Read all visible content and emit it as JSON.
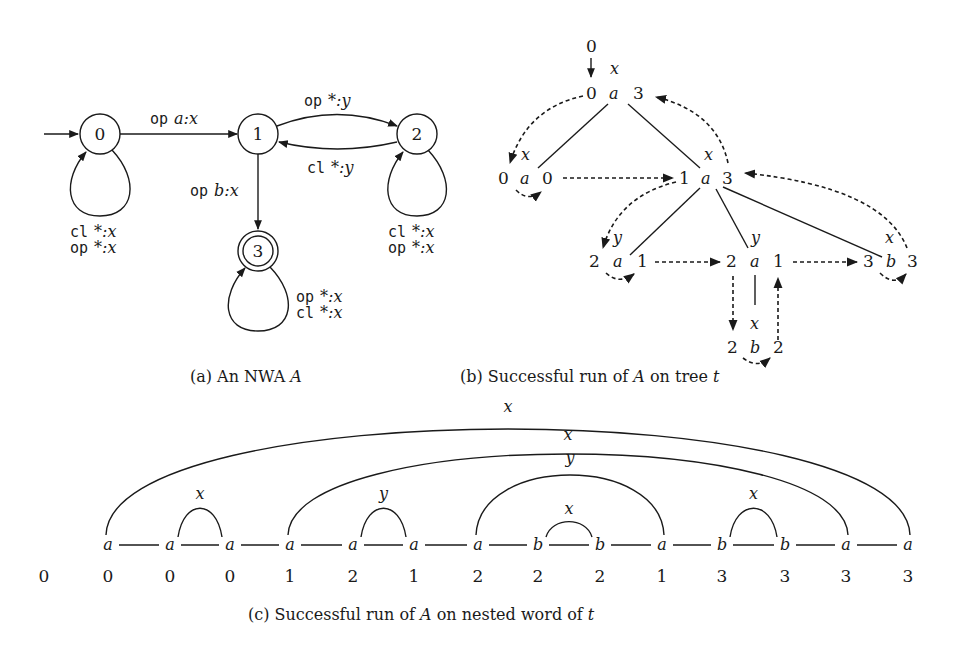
{
  "figure": {
    "panel_a": {
      "caption": "(a) An NWA A",
      "caption_prefix": "(a) An NWA ",
      "caption_var": "A",
      "states": [
        {
          "id": "0",
          "initial": true,
          "final": false
        },
        {
          "id": "1",
          "initial": false,
          "final": false
        },
        {
          "id": "2",
          "initial": false,
          "final": false
        },
        {
          "id": "3",
          "initial": false,
          "final": true
        }
      ],
      "transitions": [
        {
          "from": "0",
          "to": "1",
          "kw": "op",
          "label": "a:x"
        },
        {
          "from": "1",
          "to": "2",
          "kw": "op",
          "label": "*:y"
        },
        {
          "from": "2",
          "to": "1",
          "kw": "cl",
          "label": "*:y"
        },
        {
          "from": "1",
          "to": "3",
          "kw": "op",
          "label": "b:x"
        }
      ],
      "loops": {
        "s0": [
          {
            "kw": "cl",
            "label": "*:x"
          },
          {
            "kw": "op",
            "label": "*:x"
          }
        ],
        "s2": [
          {
            "kw": "cl",
            "label": "*:x"
          },
          {
            "kw": "op",
            "label": "*:x"
          }
        ],
        "s3": [
          {
            "kw": "op",
            "label": "*:x"
          },
          {
            "kw": "cl",
            "label": "*:x"
          }
        ]
      }
    },
    "panel_b": {
      "caption_prefix": "(b) Successful run of ",
      "caption_var": "A",
      "caption_mid": " on tree ",
      "caption_var2": "t",
      "root_state": "0",
      "root_label": "x",
      "nodes": [
        {
          "id": "root",
          "left": "0",
          "sym": "a",
          "right": "3",
          "label": "x"
        },
        {
          "id": "n1",
          "left": "0",
          "sym": "a",
          "right": "0",
          "label": "x"
        },
        {
          "id": "n2",
          "left": "1",
          "sym": "a",
          "right": "3",
          "label": "x"
        },
        {
          "id": "n21",
          "left": "2",
          "sym": "a",
          "right": "1",
          "label": "y"
        },
        {
          "id": "n22",
          "left": "2",
          "sym": "a",
          "right": "1",
          "label": "y"
        },
        {
          "id": "n23",
          "left": "3",
          "sym": "b",
          "right": "3",
          "label": "x"
        },
        {
          "id": "n221",
          "left": "2",
          "sym": "b",
          "right": "2",
          "label": "x"
        }
      ]
    },
    "panel_c": {
      "caption_prefix": "(c) Successful run of ",
      "caption_var": "A",
      "caption_mid": " on nested word of ",
      "caption_var2": "t",
      "initial_state": "0",
      "symbols": [
        "a",
        "a",
        "a",
        "a",
        "a",
        "a",
        "a",
        "b",
        "b",
        "a",
        "b",
        "b",
        "a",
        "a"
      ],
      "states": [
        "0",
        "0",
        "0",
        "1",
        "2",
        "1",
        "2",
        "2",
        "2",
        "1",
        "3",
        "3",
        "3",
        "3"
      ],
      "nesting_edges": [
        {
          "from": 0,
          "to": 13,
          "label": "x"
        },
        {
          "from": 1,
          "to": 2,
          "label": "x"
        },
        {
          "from": 3,
          "to": 12,
          "label": "x"
        },
        {
          "from": 4,
          "to": 5,
          "label": "y"
        },
        {
          "from": 6,
          "to": 9,
          "label": "y"
        },
        {
          "from": 7,
          "to": 8,
          "label": "x"
        },
        {
          "from": 10,
          "to": 11,
          "label": "x"
        }
      ]
    }
  }
}
